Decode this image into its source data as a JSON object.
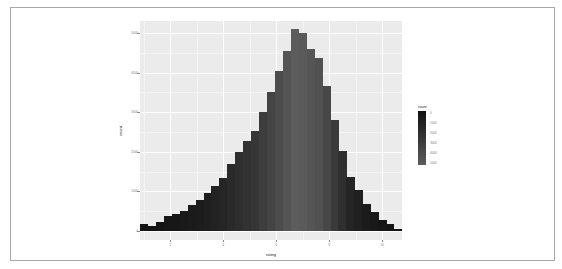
{
  "chart_data": {
    "type": "bar",
    "subtype": "histogram",
    "title": "",
    "xlabel": "rating",
    "ylabel": "count",
    "x_ticks": [
      "2",
      "4",
      "6",
      "8",
      "10"
    ],
    "y_ticks": [
      "0",
      "1000",
      "2000",
      "3000",
      "4000",
      "5000"
    ],
    "xlim": [
      0.85,
      10.75
    ],
    "ylim": [
      0,
      5250
    ],
    "grid": true,
    "fill_by": "count",
    "legend": {
      "title": "count",
      "position": "right",
      "labels": [
        "0",
        "1000",
        "2000",
        "3000",
        "4000",
        "5000"
      ],
      "gradient": [
        "#132B43",
        "#5a5a5a"
      ]
    },
    "bins": {
      "binwidth": 0.3,
      "x_start": 1.0,
      "counts": [
        170,
        130,
        230,
        380,
        430,
        510,
        660,
        780,
        960,
        1130,
        1340,
        1680,
        1990,
        2270,
        2530,
        3000,
        3500,
        4040,
        4550,
        5100,
        4990,
        4590,
        4360,
        3670,
        2810,
        2010,
        1370,
        1040,
        690,
        480,
        280,
        180,
        50,
        20
      ]
    }
  },
  "frame": {
    "border_color": "#a8a8a8"
  },
  "panel": {
    "background": "#ebebeb",
    "grid_color": "#ffffff"
  }
}
